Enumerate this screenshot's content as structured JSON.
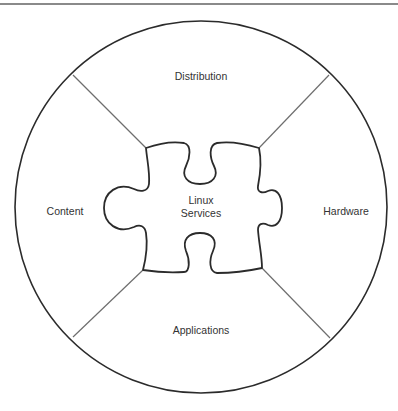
{
  "diagram": {
    "center_label": [
      "Linux",
      "Services"
    ],
    "segments": [
      {
        "id": "top",
        "label": "Distribution"
      },
      {
        "id": "right",
        "label": "Hardware"
      },
      {
        "id": "bottom",
        "label": "Applications"
      },
      {
        "id": "left",
        "label": "Content"
      }
    ],
    "colors": {
      "outline": "#2b2b2b",
      "divider": "#6e6e6e",
      "text": "#333333",
      "top_rule": "#8a8a8a"
    }
  }
}
